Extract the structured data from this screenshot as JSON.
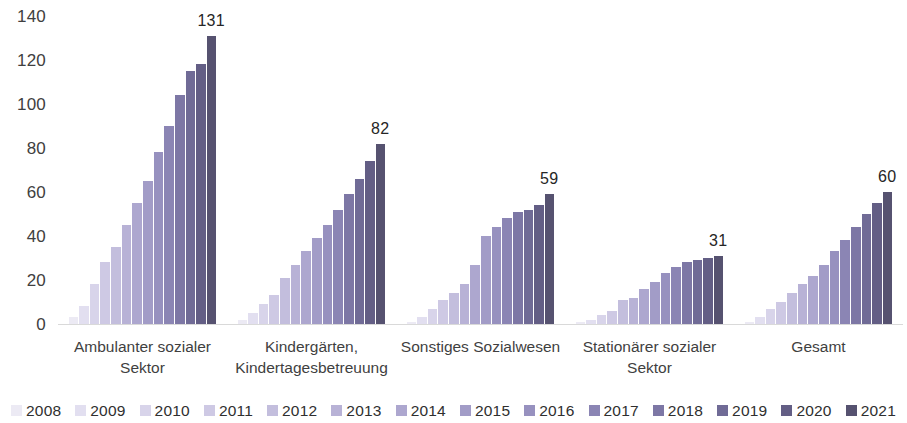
{
  "chart_data": {
    "type": "bar",
    "title": "",
    "subtitle": "",
    "xlabel": "",
    "ylabel": "",
    "ylim": [
      0,
      140
    ],
    "ytick_values": [
      0,
      20,
      40,
      60,
      80,
      100,
      120,
      140
    ],
    "ytick_labels": [
      "0",
      "20",
      "40",
      "60",
      "80",
      "100",
      "120",
      "140"
    ],
    "grid": false,
    "legend_position": "bottom",
    "categories": [
      "Ambulanter sozialer\nSektor",
      "Kindergärten,\nKindertagesbetreuung",
      "Sonstiges Sozialwesen",
      "Stationärer sozialer\nSektor",
      "Gesamt"
    ],
    "series": [
      {
        "name": "2008",
        "color": "#eceaf4",
        "values": [
          3,
          2,
          1,
          1,
          1
        ]
      },
      {
        "name": "2009",
        "color": "#e2dff0",
        "values": [
          8,
          5,
          3,
          2,
          3
        ]
      },
      {
        "name": "2010",
        "color": "#d8d4ea",
        "values": [
          18,
          9,
          7,
          4,
          7
        ]
      },
      {
        "name": "2011",
        "color": "#cec9e4",
        "values": [
          28,
          13,
          11,
          6,
          10
        ]
      },
      {
        "name": "2012",
        "color": "#c3bedd",
        "values": [
          35,
          21,
          14,
          11,
          14
        ]
      },
      {
        "name": "2013",
        "color": "#b8b2d6",
        "values": [
          45,
          27,
          18,
          12,
          18
        ]
      },
      {
        "name": "2014",
        "color": "#ada7cf",
        "values": [
          55,
          33,
          27,
          16,
          22
        ]
      },
      {
        "name": "2015",
        "color": "#a29cc7",
        "values": [
          65,
          39,
          40,
          19,
          27
        ]
      },
      {
        "name": "2016",
        "color": "#9791bf",
        "values": [
          78,
          45,
          44,
          23,
          33
        ]
      },
      {
        "name": "2017",
        "color": "#8b85b4",
        "values": [
          90,
          52,
          48,
          26,
          38
        ]
      },
      {
        "name": "2018",
        "color": "#7d77a5",
        "values": [
          104,
          59,
          51,
          28,
          44
        ]
      },
      {
        "name": "2019",
        "color": "#706b96",
        "values": [
          115,
          66,
          52,
          29,
          50
        ]
      },
      {
        "name": "2020",
        "color": "#635e85",
        "values": [
          118,
          74,
          54,
          30,
          55
        ]
      },
      {
        "name": "2021",
        "color": "#565270",
        "values": [
          131,
          82,
          59,
          31,
          60
        ]
      }
    ],
    "data_labels": [
      "131",
      "82",
      "59",
      "31",
      "60"
    ],
    "data_label_series": "2021"
  }
}
